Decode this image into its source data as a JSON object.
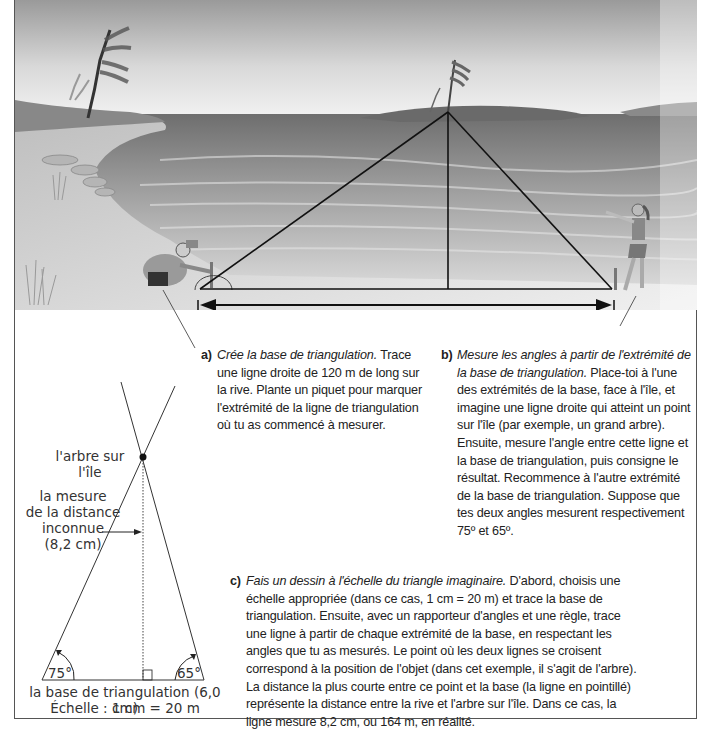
{
  "illustration": {
    "description": "Lake shore scene with a person at a stake on the left, a girl pointing at the right, and a tree on the island; triangle drawn from both ends of the baseline to the tree",
    "labels": {
      "base_marker_left": "I",
      "base_marker_right": "I"
    }
  },
  "steps": {
    "a": {
      "label": "a)",
      "title": "Crée la base de triangulation.",
      "text": " Trace une ligne droite de 120 m de long sur la rive. Plante un piquet pour marquer l'extrémité de la ligne de triangulation où tu as commencé à mesurer."
    },
    "b": {
      "label": "b)",
      "title": "Mesure les angles à partir de l'extrémité de la base de triangulation.",
      "text": " Place-toi à l'une des extrémités de la base, face à l'île, et imagine une ligne droite qui atteint un point sur l'île (par exemple, un grand arbre). Ensuite, mesure l'angle entre cette ligne et la base de triangulation, puis consigne le résultat. Recommence à l'autre extrémité de la base de triangulation. Suppose que tes deux angles mesurent respectivement 75º et 65º."
    },
    "c": {
      "label": "c)",
      "title": "Fais un dessin à l'échelle du triangle imaginaire.",
      "text": " D'abord, choisis une échelle appropriée (dans ce cas, 1 cm = 20 m) et trace la base de triangulation. Ensuite, avec un rapporteur d'angles et une règle, trace une ligne à partir de chaque extrémité de la base, en respectant les angles que tu as mesurés. Le point où les deux lignes se croisent correspond à la position de l'objet (dans cet exemple, il s'agit de l'arbre). La distance la plus courte entre ce point et la base (la ligne en pointillé) représente la distance entre la rive et l'arbre sur l'île. Dans ce cas, la ligne mesure 8,2 cm, ou 164 m, en réalité."
    }
  },
  "diagram": {
    "tree_label": "l'arbre sur l'île",
    "distance_label_lines": [
      "la mesure",
      "de la distance",
      "inconnue",
      "(8,2 cm)"
    ],
    "angle_left": "75°",
    "angle_right": "65°",
    "base_label": "la base de triangulation (6,0 cm)",
    "scale_label": "Échelle : 1 cm = 20 m"
  }
}
